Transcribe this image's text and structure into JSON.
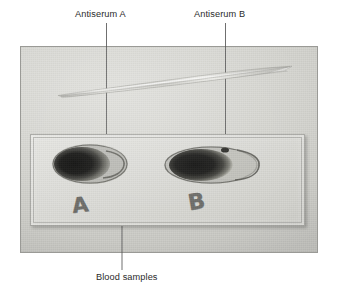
{
  "annotations": {
    "antiserum_a": {
      "label": "Antiserum A",
      "leader": "vertical-line-down-to-left-drop"
    },
    "antiserum_b": {
      "label": "Antiserum B",
      "leader": "vertical-line-down-to-right-drop"
    },
    "blood_samples": {
      "label": "Blood samples",
      "leader": "v-shaped-line-to-both-drops"
    }
  },
  "photo": {
    "objects": {
      "lancet": "lancet-needle",
      "slide": "glass-microscope-slide",
      "drop_left": "blood-drop-a",
      "drop_right": "blood-drop-b"
    },
    "slide_marks": {
      "left": "A",
      "right": "B"
    }
  },
  "colors": {
    "photo_background": "#d7d7d2",
    "slide": "#e0e0dc",
    "blood_drop": "#1a1a18",
    "text": "#2b2b2b",
    "leader_line": "#555555",
    "page_background": "#ffffff"
  }
}
